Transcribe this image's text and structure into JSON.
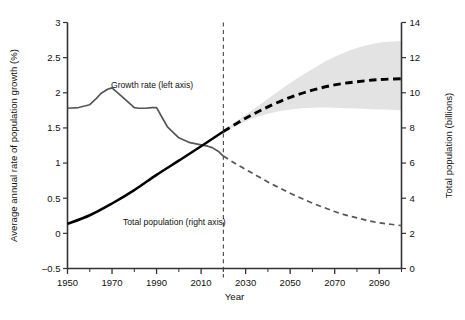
{
  "chart_data": {
    "type": "line",
    "title": "",
    "subtitle": "",
    "xlabel": "Year",
    "ylabel_left": "Average annual rate of population growth (%)",
    "ylabel_right": "Total population (billions)",
    "xlim": [
      1950,
      2100
    ],
    "xticks": [
      1950,
      1970,
      1990,
      2010,
      2030,
      2050,
      2070,
      2090
    ],
    "xtick_labels": [
      "1950",
      "1970",
      "1990",
      "2010",
      "2030",
      "2050",
      "2070",
      "2090"
    ],
    "xminor_step": 10,
    "ylim_left": [
      -0.5,
      3
    ],
    "yticks_left": [
      -0.5,
      0,
      0.5,
      1,
      1.5,
      2,
      2.5,
      3
    ],
    "ytick_labels_left": [
      "–0.5",
      "0",
      "0.5",
      "1",
      "1.5",
      "2",
      "2.5",
      "3"
    ],
    "ylim_right": [
      0,
      14
    ],
    "yticks_right": [
      0,
      2,
      4,
      6,
      8,
      10,
      12,
      14
    ],
    "ytick_labels_right": [
      "0",
      "2",
      "4",
      "6",
      "8",
      "10",
      "12",
      "14"
    ],
    "grid": false,
    "legend_position": "inline-annotations",
    "projection_divider_year": 2020,
    "annotations": [
      {
        "name": "growth-rate-label",
        "text": "Growth rate (left axis)",
        "x": 1988,
        "y_left": 2.07,
        "axis": "left"
      },
      {
        "name": "total-population-label",
        "text": "Total population (right axis)",
        "x": 1998,
        "y_right": 2.45,
        "axis": "right"
      }
    ],
    "series": [
      {
        "name": "Growth rate (left axis)",
        "axis": "left",
        "unit": "%",
        "color": "#565656",
        "style": "solid",
        "segment": "observed",
        "x": [
          1950,
          1955,
          1960,
          1963,
          1965,
          1968,
          1970,
          1975,
          1980,
          1982,
          1985,
          1988,
          1990,
          1993,
          1995,
          2000,
          2005,
          2010,
          2013,
          2015,
          2018,
          2020
        ],
        "values": [
          1.78,
          1.79,
          1.83,
          1.92,
          1.99,
          2.05,
          2.07,
          1.93,
          1.79,
          1.78,
          1.78,
          1.79,
          1.79,
          1.62,
          1.51,
          1.36,
          1.29,
          1.26,
          1.24,
          1.22,
          1.16,
          1.1
        ]
      },
      {
        "name": "Growth rate projection",
        "axis": "left",
        "unit": "%",
        "color": "#565656",
        "style": "dashed",
        "segment": "projected",
        "x": [
          2020,
          2025,
          2030,
          2035,
          2040,
          2045,
          2050,
          2055,
          2060,
          2065,
          2070,
          2075,
          2080,
          2085,
          2090,
          2095,
          2100
        ],
        "values": [
          1.1,
          1.0,
          0.91,
          0.82,
          0.73,
          0.65,
          0.57,
          0.5,
          0.43,
          0.37,
          0.31,
          0.26,
          0.22,
          0.18,
          0.15,
          0.13,
          0.11
        ]
      },
      {
        "name": "Total population (right axis)",
        "axis": "right",
        "unit": "billions",
        "color": "#000000",
        "style": "solid",
        "segment": "observed",
        "x": [
          1950,
          1960,
          1970,
          1980,
          1990,
          2000,
          2010,
          2020
        ],
        "values": [
          2.54,
          3.03,
          3.7,
          4.46,
          5.33,
          6.14,
          6.96,
          7.8
        ]
      },
      {
        "name": "Total population projection",
        "axis": "right",
        "unit": "billions",
        "color": "#000000",
        "style": "dashed",
        "segment": "projected",
        "x": [
          2020,
          2030,
          2040,
          2050,
          2060,
          2070,
          2080,
          2090,
          2100
        ],
        "values": [
          7.8,
          8.55,
          9.2,
          9.74,
          10.15,
          10.45,
          10.63,
          10.75,
          10.8
        ]
      }
    ],
    "uncertainty_band": {
      "name": "Total population 95% projection interval",
      "axis": "right",
      "color": "#e3e3e3",
      "x": [
        2020,
        2030,
        2040,
        2050,
        2060,
        2070,
        2080,
        2090,
        2100
      ],
      "upper": [
        7.85,
        8.75,
        9.65,
        10.55,
        11.35,
        12.05,
        12.55,
        12.85,
        12.95
      ],
      "lower": [
        7.75,
        8.38,
        8.8,
        9.05,
        9.15,
        9.15,
        9.1,
        9.05,
        9.0
      ]
    }
  }
}
